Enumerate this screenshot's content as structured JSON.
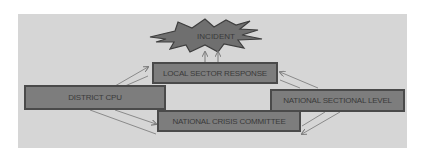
{
  "diagram": {
    "type": "flow",
    "nodes": {
      "incident": "INCIDENT",
      "local_sector_response": "LOCAL SECTOR RESPONSE",
      "district_cpu": "DISTRICT CPU",
      "national_sectional_level": "NATIONAL SECTIONAL LEVEL",
      "national_crisis_committee": "NATIONAL CRISIS COMMITTEE"
    },
    "edges": [
      {
        "from": "local_sector_response",
        "to": "incident"
      },
      {
        "from": "district_cpu",
        "to": "local_sector_response"
      },
      {
        "from": "district_cpu",
        "to": "national_crisis_committee"
      },
      {
        "from": "national_sectional_level",
        "to": "local_sector_response"
      },
      {
        "from": "national_sectional_level",
        "to": "national_crisis_committee"
      }
    ],
    "colors": {
      "background": "#d6d6d6",
      "box_fill": "#7d7d7d",
      "box_border": "#4a4a4a",
      "arrow": "#8a8a8a"
    }
  }
}
